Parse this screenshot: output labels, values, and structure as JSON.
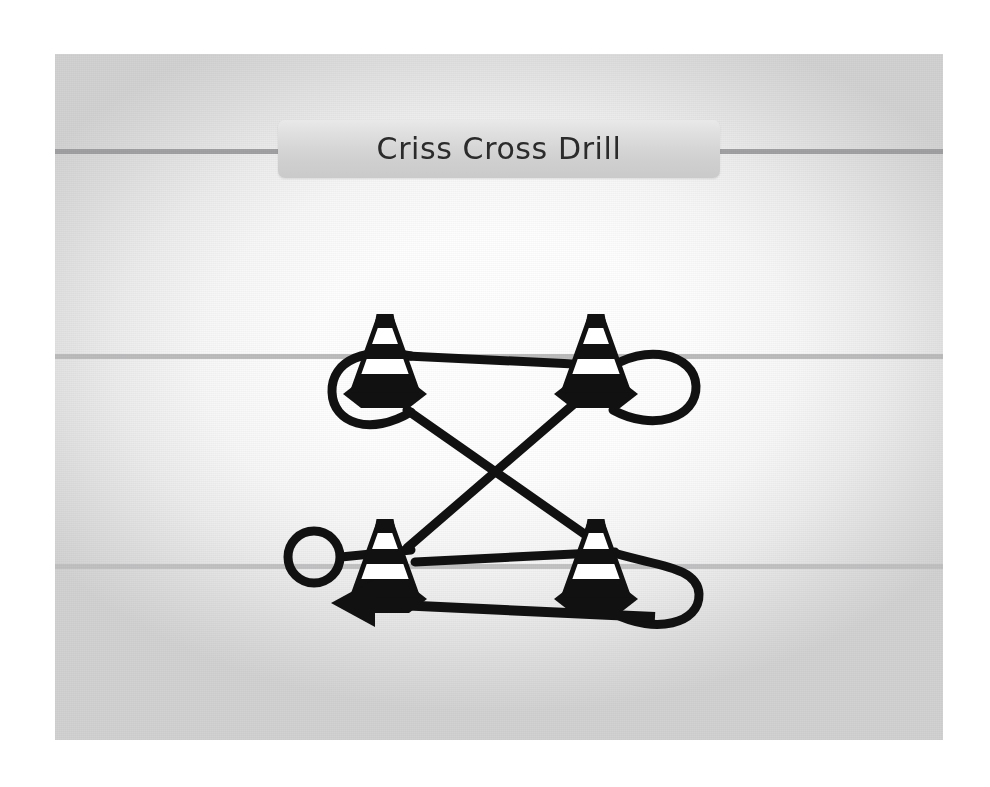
{
  "slide": {
    "title": "Criss Cross Drill",
    "background_color": "#f2f2f2",
    "ink_color": "#111111",
    "rule_colors": [
      "#9d9d9f",
      "#b9b9ba",
      "#c0c0c1"
    ]
  },
  "diagram": {
    "type": "sports-drill-diagram",
    "name": "Criss Cross Drill",
    "cones": [
      {
        "id": "cone-top-left",
        "label": "Cone 1",
        "x": 330,
        "y": 280
      },
      {
        "id": "cone-top-right",
        "label": "Cone 2",
        "x": 540,
        "y": 280
      },
      {
        "id": "cone-bottom-left",
        "label": "Cone 3",
        "x": 330,
        "y": 485
      },
      {
        "id": "cone-bottom-right",
        "label": "Cone 4",
        "x": 540,
        "y": 485
      }
    ],
    "start_marker": {
      "id": "start-circle",
      "label": "Start",
      "x": 259,
      "y": 503,
      "radius": 26
    },
    "arrow_marker": {
      "id": "finish-arrow",
      "label": "Finish direction",
      "points": "left"
    },
    "path_stroke_width": 9,
    "path_d": "M 288 504 L 352 498 L 560 318 C 596 292 638 305 636 332 C 634 360 596 372 560 352 L 352 308 C 312 298 282 312 284 338 C 286 364 320 374 352 356 L 560 500 C 604 516 636 506 638 532 C 640 560 600 572 560 552 L 360 568 L 290 573"
  }
}
